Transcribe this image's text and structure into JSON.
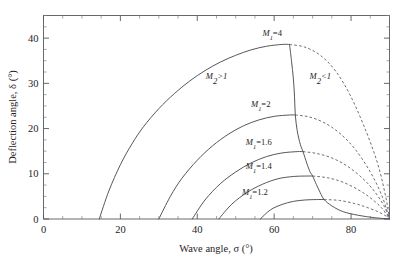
{
  "chart_data": {
    "type": "line",
    "title": "",
    "xlabel": "Wave angle, σ (°)",
    "ylabel": "Deflection angle, δ (°)",
    "xlim": [
      0,
      90
    ],
    "ylim": [
      0,
      45
    ],
    "xticks": [
      0,
      20,
      40,
      60,
      80
    ],
    "xtick_labels": [
      "0",
      "20",
      "40",
      "60",
      "80"
    ],
    "xtick_minor_step": 5,
    "yticks": [
      0,
      10,
      20,
      30,
      40
    ],
    "ytick_labels": [
      "0",
      "10",
      "20",
      "30",
      "40"
    ],
    "ytick_minor_step": 2.5,
    "grid": false,
    "legend": "none",
    "annotations": [
      {
        "name": "region-m2-supersonic",
        "text": "M₂>1",
        "x": 45,
        "y": 31
      },
      {
        "name": "region-m2-subsonic",
        "text": "M₂<1",
        "x": 72,
        "y": 31
      }
    ],
    "series": [
      {
        "name": "M₁=4",
        "label": "M₁=4",
        "label_x": 59.5,
        "label_y": 40.5,
        "style": "solid-then-dashed",
        "sigma_min": 14.5,
        "sigma_peak": 62.0,
        "delta_peak": 38.6,
        "sigma_max": 90,
        "weak_points": [
          [
            14.5,
            0.0
          ],
          [
            17,
            6.2
          ],
          [
            20,
            12.0
          ],
          [
            23,
            16.6
          ],
          [
            26,
            20.4
          ],
          [
            30,
            24.4
          ],
          [
            34,
            27.7
          ],
          [
            38,
            30.5
          ],
          [
            42,
            32.8
          ],
          [
            46,
            34.7
          ],
          [
            50,
            36.2
          ],
          [
            54,
            37.4
          ],
          [
            58,
            38.2
          ],
          [
            62,
            38.6
          ],
          [
            64,
            38.6
          ]
        ],
        "strong_points": [
          [
            64,
            38.6
          ],
          [
            68,
            38.0
          ],
          [
            72,
            36.2
          ],
          [
            76,
            32.7
          ],
          [
            80,
            27.0
          ],
          [
            84,
            19.2
          ],
          [
            87,
            12.0
          ],
          [
            89,
            5.0
          ],
          [
            90,
            0.0
          ]
        ]
      },
      {
        "name": "M₁=2",
        "label": "M₁=2",
        "label_x": 56.5,
        "label_y": 24.8,
        "style": "solid-then-dashed",
        "sigma_min": 30.0,
        "sigma_peak": 64.5,
        "delta_peak": 23.0,
        "sigma_max": 90,
        "weak_points": [
          [
            30.0,
            0.0
          ],
          [
            33,
            5.0
          ],
          [
            36,
            9.0
          ],
          [
            40,
            13.0
          ],
          [
            44,
            16.2
          ],
          [
            48,
            18.7
          ],
          [
            52,
            20.6
          ],
          [
            56,
            21.9
          ],
          [
            60,
            22.7
          ],
          [
            64,
            23.0
          ],
          [
            65.5,
            23.0
          ]
        ],
        "strong_points": [
          [
            65.5,
            23.0
          ],
          [
            69,
            22.6
          ],
          [
            73,
            21.3
          ],
          [
            77,
            19.0
          ],
          [
            81,
            15.5
          ],
          [
            85,
            10.4
          ],
          [
            88,
            5.2
          ],
          [
            90,
            0.0
          ]
        ]
      },
      {
        "name": "M₁=1.6",
        "label": "M₁=1.6",
        "label_x": 56.0,
        "label_y": 16.3,
        "style": "solid-then-dashed",
        "sigma_min": 38.7,
        "sigma_peak": 66.5,
        "delta_peak": 14.9,
        "sigma_max": 90,
        "weak_points": [
          [
            38.7,
            0.0
          ],
          [
            42,
            4.2
          ],
          [
            46,
            7.8
          ],
          [
            50,
            10.4
          ],
          [
            54,
            12.4
          ],
          [
            58,
            13.8
          ],
          [
            62,
            14.6
          ],
          [
            66,
            14.9
          ],
          [
            67.5,
            14.9
          ]
        ],
        "strong_points": [
          [
            67.5,
            14.9
          ],
          [
            71,
            14.5
          ],
          [
            75,
            13.5
          ],
          [
            79,
            11.7
          ],
          [
            83,
            9.0
          ],
          [
            86,
            6.2
          ],
          [
            88.5,
            3.0
          ],
          [
            90,
            0.0
          ]
        ]
      },
      {
        "name": "M₁=1.4",
        "label": "M₁=1.4",
        "label_x": 56.0,
        "label_y": 11.0,
        "style": "solid-then-dashed",
        "sigma_min": 45.6,
        "sigma_peak": 68.5,
        "delta_peak": 9.5,
        "sigma_max": 90,
        "weak_points": [
          [
            45.6,
            0.0
          ],
          [
            49,
            3.3
          ],
          [
            53,
            5.9
          ],
          [
            57,
            7.7
          ],
          [
            61,
            8.9
          ],
          [
            65,
            9.4
          ],
          [
            68.5,
            9.5
          ],
          [
            70,
            9.5
          ]
        ],
        "strong_points": [
          [
            70,
            9.5
          ],
          [
            74,
            9.1
          ],
          [
            78,
            8.1
          ],
          [
            82,
            6.4
          ],
          [
            85,
            4.7
          ],
          [
            88,
            2.4
          ],
          [
            90,
            0.0
          ]
        ]
      },
      {
        "name": "M₁=1.2",
        "label": "M₁=1.2",
        "label_x": 55.0,
        "label_y": 5.3,
        "style": "solid-then-dashed",
        "sigma_min": 56.4,
        "sigma_peak": 72.0,
        "delta_peak": 4.3,
        "sigma_max": 90,
        "weak_points": [
          [
            56.4,
            0.0
          ],
          [
            59,
            2.0
          ],
          [
            62,
            3.2
          ],
          [
            65,
            3.9
          ],
          [
            68,
            4.2
          ],
          [
            71,
            4.3
          ],
          [
            73,
            4.3
          ]
        ],
        "strong_points": [
          [
            73,
            4.3
          ],
          [
            77,
            4.1
          ],
          [
            81,
            3.4
          ],
          [
            84,
            2.6
          ],
          [
            87,
            1.6
          ],
          [
            89,
            0.7
          ],
          [
            90,
            0.0
          ]
        ]
      }
    ],
    "sonic_line": {
      "name": "sonic-line-m2-equals-1",
      "points": [
        [
          64,
          38.6
        ],
        [
          64.5,
          35.0
        ],
        [
          65,
          31.0
        ],
        [
          65.3,
          27.0
        ],
        [
          65.5,
          23.0
        ],
        [
          66,
          19.5
        ],
        [
          66.8,
          16.5
        ],
        [
          67.5,
          14.9
        ],
        [
          68.5,
          12.3
        ],
        [
          69.3,
          10.5
        ],
        [
          70,
          9.5
        ],
        [
          71,
          7.6
        ],
        [
          72,
          5.8
        ],
        [
          73,
          4.3
        ],
        [
          75,
          2.9
        ],
        [
          78,
          1.6
        ],
        [
          82,
          0.8
        ],
        [
          86,
          0.3
        ],
        [
          90,
          0.0
        ]
      ]
    }
  }
}
